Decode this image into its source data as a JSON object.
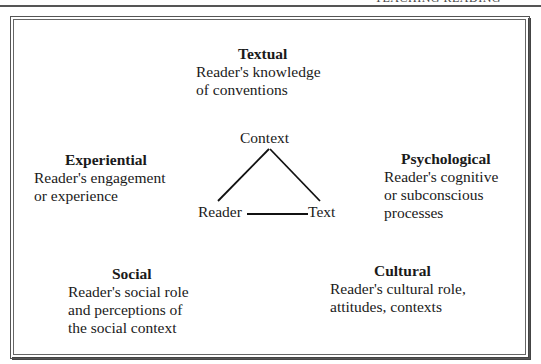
{
  "page": {
    "running_head": "TEACHING READING"
  },
  "diagram": {
    "center": {
      "top": "Context",
      "left": "Reader",
      "right": "Text"
    },
    "perspectives": [
      {
        "id": "textual",
        "title": "Textual",
        "lines": [
          "Reader's knowledge",
          "of conventions"
        ]
      },
      {
        "id": "experiential",
        "title": "Experiential",
        "lines": [
          "Reader's engagement",
          "or experience"
        ]
      },
      {
        "id": "psychological",
        "title": "Psychological",
        "lines": [
          "Reader's cognitive",
          "or subconscious",
          "processes"
        ]
      },
      {
        "id": "social",
        "title": "Social",
        "lines": [
          "Reader's social role",
          "and perceptions of",
          "the social context"
        ]
      },
      {
        "id": "cultural",
        "title": "Cultural",
        "lines": [
          "Reader's cultural role,",
          "attitudes, contexts"
        ]
      }
    ]
  }
}
